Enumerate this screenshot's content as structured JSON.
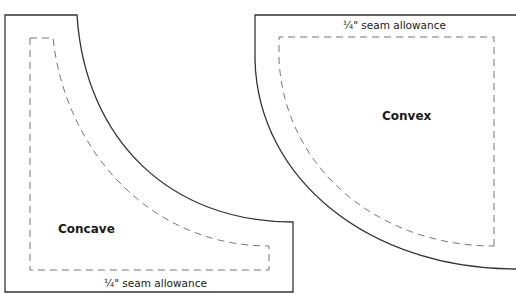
{
  "pieces": [
    {
      "name": "Concave",
      "seam_label": "¼\" seam allowance"
    },
    {
      "name": "Convex",
      "seam_label": "¼\" seam allowance"
    }
  ],
  "colors": {
    "cut_line": "#333333",
    "seam_line": "#777777"
  }
}
